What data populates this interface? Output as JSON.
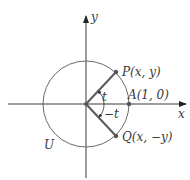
{
  "diagram": {
    "axes": {
      "x_label": "x",
      "y_label": "y"
    },
    "circle_label": "U",
    "points": {
      "P": {
        "label": "P(x, y)"
      },
      "A": {
        "label": "A(1, 0)"
      },
      "Q": {
        "label": "Q(x, −y)"
      }
    },
    "angles": {
      "positive": "t",
      "negative": "−t"
    },
    "colors": {
      "circle": "#6b6b6b",
      "radius": "#5a5a5a",
      "axes": "#3a3a3a",
      "point": "#555555"
    }
  }
}
